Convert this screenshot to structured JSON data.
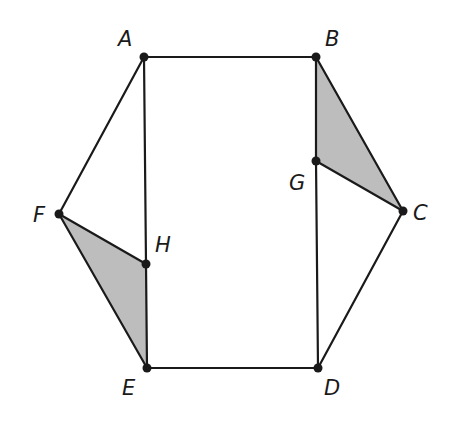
{
  "diagram": {
    "type": "geometry-figure",
    "colors": {
      "stroke": "#1a1a1a",
      "shade": "#bdbdbd",
      "background": "#ffffff"
    },
    "points": [
      {
        "name": "A",
        "x": 144,
        "y": 57,
        "lx": 118,
        "ly": 46
      },
      {
        "name": "B",
        "x": 316,
        "y": 57,
        "lx": 325,
        "ly": 46
      },
      {
        "name": "C",
        "x": 403,
        "y": 211,
        "lx": 413,
        "ly": 220
      },
      {
        "name": "D",
        "x": 318,
        "y": 368,
        "lx": 324,
        "ly": 395
      },
      {
        "name": "E",
        "x": 147,
        "y": 368,
        "lx": 122,
        "ly": 395
      },
      {
        "name": "F",
        "x": 59,
        "y": 214,
        "lx": 33,
        "ly": 222
      },
      {
        "name": "G",
        "x": 316,
        "y": 161,
        "lx": 289,
        "ly": 190
      },
      {
        "name": "H",
        "x": 146,
        "y": 264,
        "lx": 155,
        "ly": 252
      }
    ],
    "labels": [
      "A",
      "B",
      "C",
      "D",
      "E",
      "F",
      "G",
      "H"
    ],
    "segments": [
      "AB",
      "BC",
      "CD",
      "DE",
      "EF",
      "FA",
      "AH",
      "HE",
      "BG",
      "GD",
      "GC",
      "FH"
    ],
    "shaded_triangles": [
      "BGC",
      "FHE"
    ]
  }
}
